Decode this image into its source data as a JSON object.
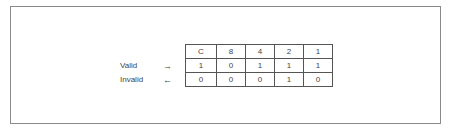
{
  "diagram": {
    "header": [
      "C",
      "8",
      "4",
      "2",
      "1"
    ],
    "rows": [
      {
        "label": "Valid",
        "arrow": "→",
        "values": [
          "1",
          "0",
          "1",
          "1",
          "1"
        ]
      },
      {
        "label": "Invalid",
        "arrow": "←",
        "values": [
          "0",
          "0",
          "0",
          "1",
          "0"
        ]
      }
    ]
  }
}
